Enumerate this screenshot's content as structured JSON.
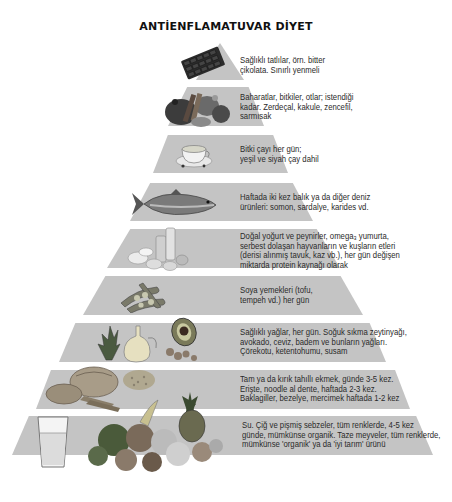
{
  "title": "ANTİENFLAMATUVAR DİYET",
  "band_color": "#c4c4c4",
  "tiers": [
    {
      "level": 1,
      "icon": "dark-chocolate-icon",
      "lines": [
        "Sağlıklı tatlılar, örn. bitter",
        "çikolata. Sınırlı yenmeli"
      ]
    },
    {
      "level": 2,
      "icon": "spices-icon",
      "lines": [
        "Baharatlar, bitkiler, otlar; istendiği",
        "kadar. Zerdeçal, kakule, zencefil,",
        "sarmısak"
      ]
    },
    {
      "level": 3,
      "icon": "tea-cup-icon",
      "lines": [
        "Bitki çayı her gün;",
        "yeşil ve siyah çay dahil"
      ]
    },
    {
      "level": 4,
      "icon": "fish-icon",
      "lines": [
        "Haftada iki kez balık ya da diğer deniz",
        "ürünleri: somon, sardalye, karides vd."
      ]
    },
    {
      "level": 5,
      "icon": "dairy-eggs-icon",
      "lines": [
        "Doğal yoğurt ve peynirler, omega₃ yumurta,",
        "serbest dolaşan hayvanların ve kuşların etleri",
        "(derisi alınmış tavuk, kaz vb.), her gün değişen",
        "miktarda protein kaynağı olarak"
      ]
    },
    {
      "level": 6,
      "icon": "soybeans-icon",
      "lines": [
        "Soya yemekleri (tofu,",
        "tempeh vd.) her gün"
      ]
    },
    {
      "level": 7,
      "icon": "olive-oil-avocado-icon",
      "lines": [
        "Sağlıklı yağlar, her gün. Soğuk sıkma zeytinyağı,",
        "avokado, ceviz, badem ve bunların yağları.",
        "Çörekotu, ketentohumu, susam"
      ]
    },
    {
      "level": 8,
      "icon": "bread-grains-icon",
      "lines": [
        "Tam ya da kırık tahıllı ekmek, günde 3-5 kez.",
        "Erişte, noodle al dente, haftada 2-3 kez.",
        "Baklagiller, bezelye, mercimek haftada 1-2 kez"
      ]
    },
    {
      "level": 9,
      "icon": "water-vegetables-fruits-icon",
      "lines": [
        "Su. Çiğ ve pişmiş sebzeler, tüm renklerde, 4-5 kez",
        "günde, mümkünse organik. Taze meyveler, tüm renklerde,",
        "mümkünse 'organik' ya da 'iyi tarım' ürünü"
      ]
    }
  ]
}
